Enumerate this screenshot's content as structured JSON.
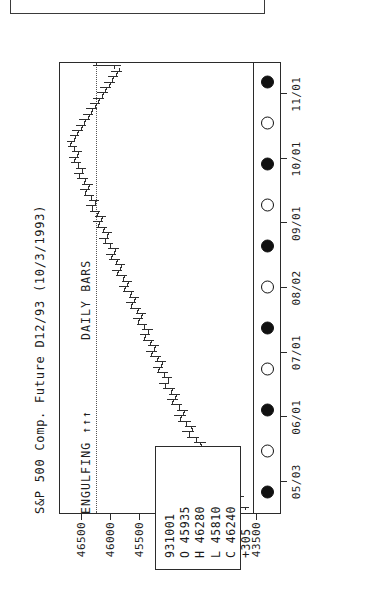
{
  "window": {
    "top_panel_label": ""
  },
  "chart_data": {
    "type": "bar",
    "subtype": "ohlc-daily-bars",
    "title": "S&P 500 Comp. Future D12/93 (10/3/1993)",
    "instrument": "S&P 500 Comp. Future",
    "contract": "D12/93",
    "as_of_date": "(10/3/1993)",
    "xlabel": "",
    "ylabel": "",
    "grid": false,
    "legend_position": "none",
    "ylim": [
      43500,
      46750
    ],
    "ytick_labels": [
      "46500",
      "46000",
      "45500",
      "45000",
      "44500",
      "44000",
      "43500"
    ],
    "ytick_values": [
      46500,
      46000,
      45500,
      45000,
      44500,
      44000,
      43500
    ],
    "xtick_labels": [
      "05/03",
      "06/01",
      "07/01",
      "08/02",
      "09/01",
      "10/01",
      "11/01"
    ],
    "marker_sequence": [
      "filled",
      "hollow",
      "filled",
      "hollow",
      "filled",
      "hollow",
      "filled",
      "hollow",
      "filled",
      "hollow",
      "filled"
    ],
    "reference_line_value": 46240,
    "captions": {
      "left": "ENGULFING",
      "left_arrows": "↑↑↑",
      "middle": "DAILY BARS"
    },
    "quote_box": {
      "date": "931001",
      "open_label": "O",
      "open": "45935",
      "high_label": "H",
      "high": "46280",
      "low_label": "L",
      "low": "45810",
      "close_label": "C",
      "close": "46240",
      "change": "+305"
    },
    "series": [
      {
        "name": "OHLC daily bars",
        "bars": [
          [
            43680,
            43900,
            43620,
            43860
          ],
          [
            43850,
            43960,
            43780,
            43800
          ],
          [
            43790,
            43880,
            43700,
            43840
          ],
          [
            43830,
            44060,
            43810,
            44020
          ],
          [
            44000,
            44180,
            43950,
            44150
          ],
          [
            44140,
            44260,
            44050,
            44090
          ],
          [
            44080,
            44200,
            44000,
            44180
          ],
          [
            44170,
            44330,
            44120,
            44300
          ],
          [
            44290,
            44420,
            44230,
            44250
          ],
          [
            44260,
            44380,
            44180,
            44360
          ],
          [
            44350,
            44520,
            44300,
            44480
          ],
          [
            44470,
            44600,
            44410,
            44440
          ],
          [
            44450,
            44560,
            44360,
            44530
          ],
          [
            44520,
            44680,
            44470,
            44650
          ],
          [
            44640,
            44760,
            44560,
            44600
          ],
          [
            44610,
            44720,
            44530,
            44700
          ],
          [
            44690,
            44840,
            44620,
            44800
          ],
          [
            44790,
            44900,
            44700,
            44740
          ],
          [
            44730,
            44850,
            44660,
            44820
          ],
          [
            44810,
            44960,
            44760,
            44930
          ],
          [
            44920,
            45020,
            44840,
            44880
          ],
          [
            44870,
            44980,
            44800,
            44950
          ],
          [
            44940,
            45090,
            44890,
            45060
          ],
          [
            45050,
            45160,
            44980,
            45010
          ],
          [
            45000,
            45110,
            44930,
            45080
          ],
          [
            45070,
            45200,
            45010,
            45170
          ],
          [
            45160,
            45260,
            45090,
            45120
          ],
          [
            45110,
            45220,
            45040,
            45190
          ],
          [
            45180,
            45320,
            45130,
            45290
          ],
          [
            45280,
            45380,
            45200,
            45240
          ],
          [
            45230,
            45340,
            45160,
            45310
          ],
          [
            45300,
            45440,
            45250,
            45410
          ],
          [
            45400,
            45490,
            45320,
            45350
          ],
          [
            45340,
            45450,
            45270,
            45420
          ],
          [
            45410,
            45540,
            45360,
            45510
          ],
          [
            45500,
            45600,
            45430,
            45460
          ],
          [
            45450,
            45560,
            45380,
            45530
          ],
          [
            45520,
            45660,
            45470,
            45630
          ],
          [
            45620,
            45720,
            45550,
            45580
          ],
          [
            45570,
            45680,
            45500,
            45650
          ],
          [
            45640,
            45780,
            45590,
            45750
          ],
          [
            45740,
            45840,
            45670,
            45700
          ],
          [
            45690,
            45800,
            45620,
            45770
          ],
          [
            45760,
            45900,
            45710,
            45870
          ],
          [
            45860,
            45960,
            45790,
            45820
          ],
          [
            45810,
            45920,
            45740,
            45890
          ],
          [
            45880,
            46010,
            45830,
            45980
          ],
          [
            45970,
            46070,
            45900,
            45930
          ],
          [
            45920,
            46030,
            45850,
            46000
          ],
          [
            45990,
            46120,
            45940,
            46090
          ],
          [
            46080,
            46180,
            46010,
            46040
          ],
          [
            46030,
            46140,
            45960,
            46110
          ],
          [
            46100,
            46230,
            46050,
            46200
          ],
          [
            46190,
            46290,
            46120,
            46150
          ],
          [
            46140,
            46250,
            46070,
            46220
          ],
          [
            46210,
            46340,
            46160,
            46310
          ],
          [
            46300,
            46400,
            46230,
            46260
          ],
          [
            46250,
            46360,
            46180,
            46330
          ],
          [
            46320,
            46450,
            46270,
            46420
          ],
          [
            46410,
            46510,
            46340,
            46370
          ],
          [
            46360,
            46470,
            46290,
            46440
          ],
          [
            46430,
            46560,
            46380,
            46530
          ],
          [
            46520,
            46620,
            46450,
            46480
          ],
          [
            46470,
            46580,
            46400,
            46550
          ],
          [
            46540,
            46660,
            46490,
            46610
          ],
          [
            46600,
            46700,
            46520,
            46560
          ],
          [
            46550,
            46650,
            46470,
            46620
          ],
          [
            46610,
            46720,
            46560,
            46680
          ],
          [
            46670,
            46740,
            46590,
            46620
          ],
          [
            46600,
            46690,
            46520,
            46560
          ],
          [
            46540,
            46640,
            46460,
            46500
          ],
          [
            46480,
            46580,
            46400,
            46440
          ],
          [
            46420,
            46520,
            46340,
            46380
          ],
          [
            46360,
            46460,
            46280,
            46320
          ],
          [
            46300,
            46400,
            46220,
            46260
          ],
          [
            46240,
            46340,
            46160,
            46200
          ],
          [
            46180,
            46280,
            46100,
            46140
          ],
          [
            46120,
            46220,
            46040,
            46080
          ],
          [
            46060,
            46160,
            45980,
            46020
          ],
          [
            46000,
            46100,
            45920,
            45960
          ],
          [
            45940,
            46040,
            45860,
            45900
          ],
          [
            45880,
            45980,
            45800,
            45840
          ],
          [
            45935,
            46280,
            45810,
            46240
          ]
        ]
      }
    ]
  }
}
